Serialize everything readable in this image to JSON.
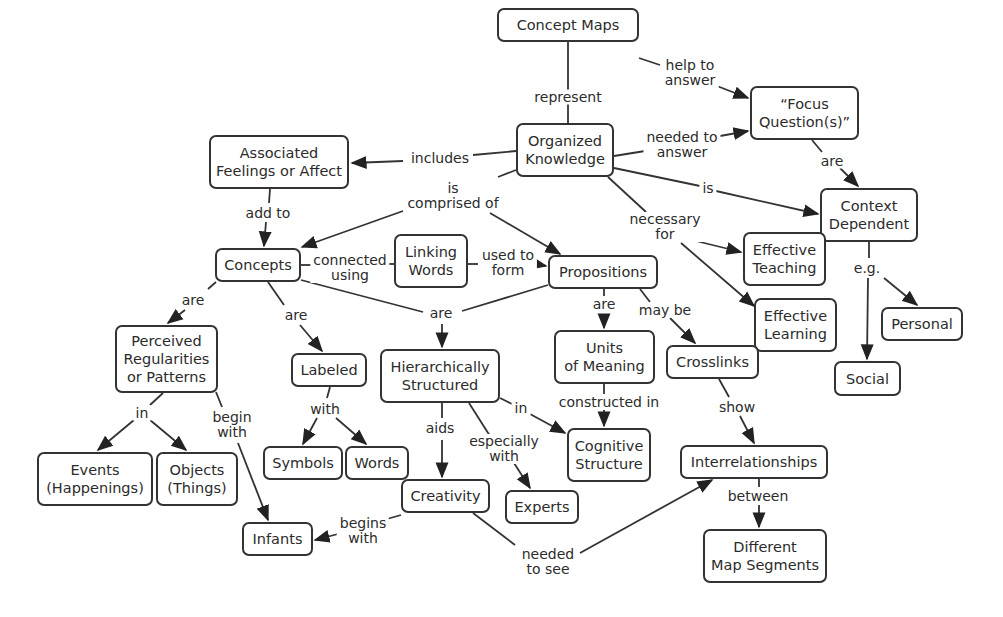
{
  "diagram": {
    "title": "Concept Maps",
    "type": "concept-map",
    "nodes": [
      {
        "id": "concept_maps",
        "label": "Concept Maps",
        "x": 497,
        "y": 8,
        "w": 142,
        "h": 34
      },
      {
        "id": "organized_knowledge",
        "label": "Organized\nKnowledge",
        "x": 516,
        "y": 123,
        "w": 98,
        "h": 54
      },
      {
        "id": "associated_feelings",
        "label": "Associated\nFeelings or Affect",
        "x": 209,
        "y": 135,
        "w": 140,
        "h": 54
      },
      {
        "id": "focus_questions",
        "label": "“Focus\nQuestion(s)”",
        "x": 750,
        "y": 86,
        "w": 109,
        "h": 54
      },
      {
        "id": "context_dependent",
        "label": "Context\nDependent",
        "x": 820,
        "y": 188,
        "w": 98,
        "h": 54
      },
      {
        "id": "concepts",
        "label": "Concepts",
        "x": 215,
        "y": 248,
        "w": 86,
        "h": 34
      },
      {
        "id": "linking_words",
        "label": "Linking\nWords",
        "x": 394,
        "y": 234,
        "w": 74,
        "h": 54
      },
      {
        "id": "propositions",
        "label": "Propositions",
        "x": 548,
        "y": 255,
        "w": 110,
        "h": 34
      },
      {
        "id": "effective_teaching",
        "label": "Effective\nTeaching",
        "x": 743,
        "y": 232,
        "w": 83,
        "h": 54
      },
      {
        "id": "effective_learning",
        "label": "Effective\nLearning",
        "x": 754,
        "y": 298,
        "w": 83,
        "h": 54
      },
      {
        "id": "personal",
        "label": "Personal",
        "x": 881,
        "y": 307,
        "w": 82,
        "h": 34
      },
      {
        "id": "perceived_regularities",
        "label": "Perceived\nRegularities\nor Patterns",
        "x": 115,
        "y": 325,
        "w": 103,
        "h": 68
      },
      {
        "id": "labeled",
        "label": "Labeled",
        "x": 291,
        "y": 353,
        "w": 76,
        "h": 34
      },
      {
        "id": "hierarchically_structured",
        "label": "Hierarchically\nStructured",
        "x": 380,
        "y": 349,
        "w": 120,
        "h": 54
      },
      {
        "id": "units_of_meaning",
        "label": "Units\nof Meaning",
        "x": 554,
        "y": 330,
        "w": 101,
        "h": 54
      },
      {
        "id": "crosslinks",
        "label": "Crosslinks",
        "x": 666,
        "y": 345,
        "w": 93,
        "h": 34
      },
      {
        "id": "social",
        "label": "Social",
        "x": 834,
        "y": 361,
        "w": 67,
        "h": 35
      },
      {
        "id": "events",
        "label": "Events\n(Happenings)",
        "x": 37,
        "y": 452,
        "w": 116,
        "h": 54
      },
      {
        "id": "objects",
        "label": "Objects\n(Things)",
        "x": 156,
        "y": 452,
        "w": 82,
        "h": 54
      },
      {
        "id": "symbols",
        "label": "Symbols",
        "x": 263,
        "y": 446,
        "w": 80,
        "h": 34
      },
      {
        "id": "words",
        "label": "Words",
        "x": 345,
        "y": 446,
        "w": 64,
        "h": 34
      },
      {
        "id": "cognitive_structure",
        "label": "Cognitive\nStructure",
        "x": 567,
        "y": 428,
        "w": 84,
        "h": 54
      },
      {
        "id": "interrelationships",
        "label": "Interrelationships",
        "x": 680,
        "y": 445,
        "w": 148,
        "h": 34
      },
      {
        "id": "creativity",
        "label": "Creativity",
        "x": 401,
        "y": 479,
        "w": 89,
        "h": 34
      },
      {
        "id": "experts",
        "label": "Experts",
        "x": 505,
        "y": 490,
        "w": 74,
        "h": 34
      },
      {
        "id": "infants",
        "label": "Infants",
        "x": 242,
        "y": 522,
        "w": 71,
        "h": 34
      },
      {
        "id": "different_map_segments",
        "label": "Different\nMap Segments",
        "x": 703,
        "y": 529,
        "w": 124,
        "h": 54
      }
    ],
    "links": [
      {
        "label": "represent",
        "x": 568,
        "y": 97,
        "from": "concept_maps",
        "to": [
          "organized_knowledge"
        ]
      },
      {
        "label": "help to\nanswer",
        "x": 690,
        "y": 73,
        "from": "concept_maps",
        "to": [
          "focus_questions"
        ]
      },
      {
        "label": "needed to\nanswer",
        "x": 682,
        "y": 145,
        "from": "organized_knowledge",
        "to": [
          "focus_questions"
        ]
      },
      {
        "label": "includes",
        "x": 440,
        "y": 158,
        "from": "organized_knowledge",
        "to": [
          "associated_feelings"
        ]
      },
      {
        "label": "is",
        "x": 708,
        "y": 188,
        "from": "organized_knowledge",
        "to": [
          "context_dependent"
        ]
      },
      {
        "label": "are",
        "x": 832,
        "y": 161,
        "from": "focus_questions",
        "to": [
          "context_dependent"
        ]
      },
      {
        "label": "is\ncomprised of",
        "x": 453,
        "y": 196,
        "from": "organized_knowledge",
        "to": [
          "concepts",
          "propositions"
        ]
      },
      {
        "label": "necessary\nfor",
        "x": 665,
        "y": 227,
        "from": "organized_knowledge",
        "to": [
          "effective_teaching",
          "effective_learning"
        ]
      },
      {
        "label": "add to",
        "x": 268,
        "y": 213,
        "from": "associated_feelings",
        "to": [
          "concepts"
        ]
      },
      {
        "label": "connected\nusing",
        "x": 350,
        "y": 268,
        "from": "concepts",
        "to": [
          "linking_words"
        ]
      },
      {
        "label": "used to\nform",
        "x": 508,
        "y": 263,
        "from": "linking_words",
        "to": [
          "propositions"
        ]
      },
      {
        "label": "e.g.",
        "x": 867,
        "y": 268,
        "from": "context_dependent",
        "to": [
          "personal",
          "social"
        ]
      },
      {
        "label": "are",
        "x": 193,
        "y": 300,
        "from": "concepts",
        "to": [
          "perceived_regularities"
        ]
      },
      {
        "label": "are",
        "x": 296,
        "y": 315,
        "from": "concepts",
        "to": [
          "labeled"
        ]
      },
      {
        "label": "are",
        "x": 441,
        "y": 313,
        "from": "concepts",
        "to": [
          "hierarchically_structured"
        ]
      },
      {
        "label": "are",
        "x": 604,
        "y": 304,
        "from": "propositions",
        "to": [
          "units_of_meaning"
        ]
      },
      {
        "label": "may be",
        "x": 665,
        "y": 310,
        "from": "propositions",
        "to": [
          "crosslinks"
        ]
      },
      {
        "label": "in",
        "x": 142,
        "y": 413,
        "from": "perceived_regularities",
        "to": [
          "events",
          "objects"
        ]
      },
      {
        "label": "begin\nwith",
        "x": 232,
        "y": 425,
        "from": "perceived_regularities",
        "to": [
          "infants"
        ]
      },
      {
        "label": "with",
        "x": 325,
        "y": 409,
        "from": "labeled",
        "to": [
          "symbols",
          "words"
        ]
      },
      {
        "label": "in",
        "x": 521,
        "y": 408,
        "from": "hierarchically_structured",
        "to": [
          "cognitive_structure"
        ]
      },
      {
        "label": "aids",
        "x": 440,
        "y": 428,
        "from": "hierarchically_structured",
        "to": [
          "creativity"
        ]
      },
      {
        "label": "especially\nwith",
        "x": 504,
        "y": 449,
        "from": "hierarchically_structured",
        "to": [
          "experts"
        ]
      },
      {
        "label": "constructed in",
        "x": 609,
        "y": 402,
        "from": "units_of_meaning",
        "to": [
          "cognitive_structure"
        ]
      },
      {
        "label": "show",
        "x": 737,
        "y": 407,
        "from": "crosslinks",
        "to": [
          "interrelationships"
        ]
      },
      {
        "label": "between",
        "x": 758,
        "y": 496,
        "from": "interrelationships",
        "to": [
          "different_map_segments"
        ]
      },
      {
        "label": "begins\nwith",
        "x": 363,
        "y": 531,
        "from": "creativity",
        "to": [
          "infants"
        ]
      },
      {
        "label": "needed\nto see",
        "x": 548,
        "y": 562,
        "from": "creativity",
        "to": [
          "interrelationships"
        ]
      }
    ]
  },
  "colors": {
    "stroke": "#333333",
    "text": "#2b2b2b",
    "background": "#ffffff"
  }
}
